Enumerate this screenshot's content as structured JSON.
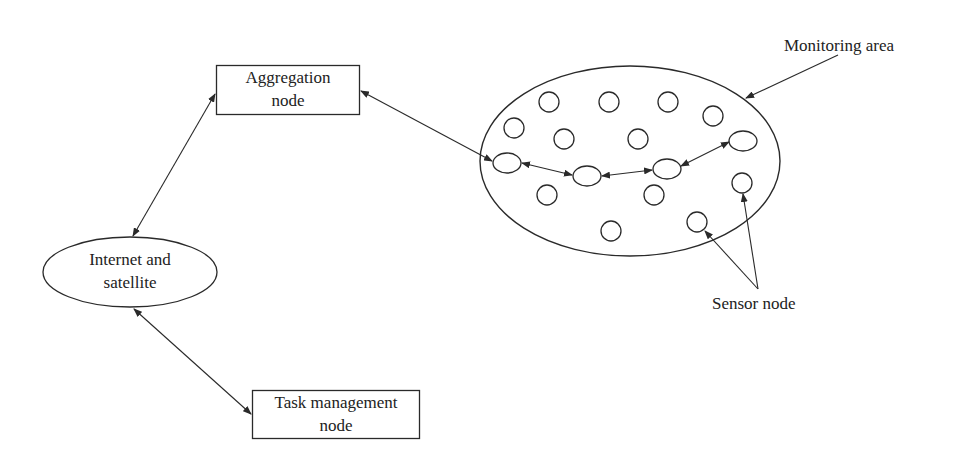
{
  "diagram": {
    "nodes": {
      "aggregation": {
        "line1": "Aggregation",
        "line2": "node"
      },
      "internet": {
        "line1": "Internet and",
        "line2": "satellite"
      },
      "task": {
        "line1": "Task management",
        "line2": "node"
      }
    },
    "labels": {
      "monitoring_area": "Monitoring area",
      "sensor_node": "Sensor node"
    },
    "colors": {
      "stroke": "#2a2a2a",
      "text": "#222222",
      "background": "#ffffff"
    },
    "sensor_circles": [
      [
        549,
        102
      ],
      [
        609,
        102
      ],
      [
        668,
        102
      ],
      [
        713,
        115
      ],
      [
        514,
        128
      ],
      [
        564,
        139
      ],
      [
        638,
        139
      ],
      [
        742,
        183
      ],
      [
        547,
        194
      ],
      [
        653,
        194
      ],
      [
        611,
        231
      ],
      [
        697,
        222
      ]
    ],
    "chain_nodes": [
      [
        507,
        163
      ],
      [
        587,
        176
      ],
      [
        667,
        169
      ],
      [
        743,
        141
      ]
    ]
  }
}
